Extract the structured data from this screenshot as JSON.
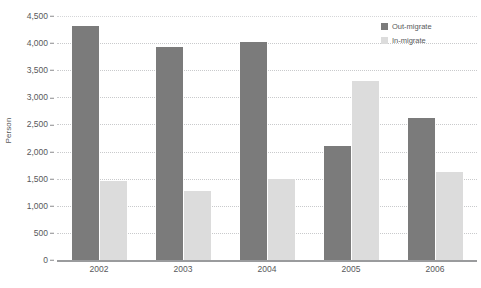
{
  "chart_data": {
    "type": "bar",
    "title": "",
    "xlabel": "",
    "ylabel": "Person",
    "categories": [
      "2002",
      "2003",
      "2004",
      "2005",
      "2006"
    ],
    "series": [
      {
        "name": "Out-migrate",
        "color": "#7b7b7b",
        "values": [
          4320,
          3920,
          4020,
          2110,
          2620
        ]
      },
      {
        "name": "In-migrate",
        "color": "#dcdcdc",
        "values": [
          1460,
          1270,
          1500,
          3300,
          1630
        ]
      }
    ],
    "ylim": [
      0,
      4500
    ],
    "ytick_values": [
      0,
      500,
      1000,
      1500,
      2000,
      2500,
      3000,
      3500,
      4000,
      4500
    ],
    "ytick_labels": [
      "0",
      "500",
      "1,000",
      "1,500",
      "2,000",
      "2,500",
      "3,000",
      "3,500",
      "4,000",
      "4,500"
    ],
    "grid": true,
    "legend_position": "top-right"
  },
  "legend": {
    "items": [
      {
        "label": "Out-migrate",
        "swatch": "out"
      },
      {
        "label": "In-migrate",
        "swatch": "in"
      }
    ]
  },
  "caption": {
    "text": ""
  }
}
